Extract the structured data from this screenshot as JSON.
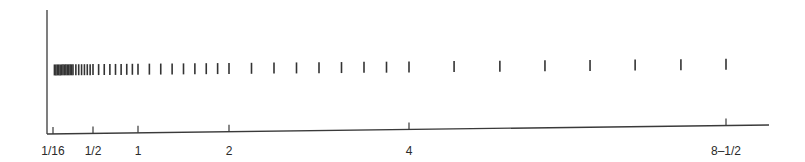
{
  "chart_data": {
    "type": "scatter",
    "subtype": "rug",
    "title": "",
    "xlabel": "",
    "ylabel": "",
    "scale": "piecewise-linear between labeled ticks",
    "xlim": [
      0.0625,
      9.0
    ],
    "grid": false,
    "legend": null,
    "ticks": [
      {
        "value": 0.0625,
        "label": "1/16"
      },
      {
        "value": 0.5,
        "label": "1/2"
      },
      {
        "value": 1,
        "label": "1"
      },
      {
        "value": 2,
        "label": "2"
      },
      {
        "value": 4,
        "label": "4"
      },
      {
        "value": 8.5,
        "label": "8–1/2"
      }
    ],
    "values": [
      0.078125,
      0.09375,
      0.109375,
      0.125,
      0.140625,
      0.15625,
      0.171875,
      0.1875,
      0.203125,
      0.21875,
      0.234375,
      0.25,
      0.265625,
      0.28125,
      0.3125,
      0.34375,
      0.375,
      0.40625,
      0.4375,
      0.46875,
      0.5,
      0.5625,
      0.625,
      0.6875,
      0.75,
      0.8125,
      0.875,
      0.9375,
      1,
      1.125,
      1.25,
      1.375,
      1.5,
      1.625,
      1.75,
      1.875,
      2,
      2.25,
      2.5,
      2.75,
      3,
      3.25,
      3.5,
      3.75,
      4,
      4.64,
      5.29,
      5.93,
      6.57,
      7.21,
      7.86,
      8.5
    ]
  }
}
